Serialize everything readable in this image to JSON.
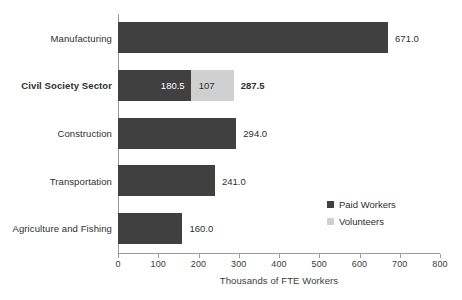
{
  "chart_data": {
    "type": "bar",
    "orientation": "horizontal",
    "stacked": true,
    "title": "",
    "xlabel": "Thousands of FTE Workers",
    "ylabel": "",
    "xlim": [
      0,
      800
    ],
    "xticks": [
      0,
      100,
      200,
      300,
      400,
      500,
      600,
      700,
      800
    ],
    "xtick_labels": [
      "0",
      "100",
      "200",
      "300",
      "400",
      "500",
      "600",
      "700",
      "800"
    ],
    "grid": false,
    "legend_position": "inside-right",
    "categories": [
      "Manufacturing",
      "Civil Society Sector",
      "Construction",
      "Transportation",
      "Agriculture and Fishing"
    ],
    "series": [
      {
        "name": "Paid Workers",
        "color": "#404040",
        "values": [
          671.0,
          180.5,
          294.0,
          241.0,
          160.0
        ]
      },
      {
        "name": "Volunteers",
        "color": "#d0d0d0",
        "values": [
          0,
          107,
          0,
          0,
          0
        ]
      }
    ],
    "totals": [
      671.0,
      287.5,
      294.0,
      241.0,
      160.0
    ],
    "data_labels": {
      "end_labels": [
        "671.0",
        "287.5",
        "294.0",
        "241.0",
        "160.0"
      ],
      "segment_labels": [
        {
          "category": "Civil Society Sector",
          "series": "Paid Workers",
          "text": "180.5"
        },
        {
          "category": "Civil Society Sector",
          "series": "Volunteers",
          "text": "107"
        }
      ]
    },
    "emphasis_category": "Civil Society Sector"
  },
  "axis": {
    "x_title": "Thousands of FTE Workers",
    "ticks": [
      {
        "label": "0",
        "value": 0
      },
      {
        "label": "100",
        "value": 100
      },
      {
        "label": "200",
        "value": 200
      },
      {
        "label": "300",
        "value": 300
      },
      {
        "label": "400",
        "value": 400
      },
      {
        "label": "500",
        "value": 500
      },
      {
        "label": "600",
        "value": 600
      },
      {
        "label": "700",
        "value": 700
      },
      {
        "label": "800",
        "value": 800
      }
    ]
  },
  "rows": [
    {
      "label": "Manufacturing",
      "bold": false,
      "paid": 671.0,
      "volunteers": 0,
      "paid_label": "",
      "volunteers_label": "",
      "end_label": "671.0",
      "end_label_bold": false
    },
    {
      "label": "Civil Society Sector",
      "bold": true,
      "paid": 180.5,
      "volunteers": 107,
      "paid_label": "180.5",
      "volunteers_label": "107",
      "end_label": "287.5",
      "end_label_bold": true
    },
    {
      "label": "Construction",
      "bold": false,
      "paid": 294.0,
      "volunteers": 0,
      "paid_label": "",
      "volunteers_label": "",
      "end_label": "294.0",
      "end_label_bold": false
    },
    {
      "label": "Transportation",
      "bold": false,
      "paid": 241.0,
      "volunteers": 0,
      "paid_label": "",
      "volunteers_label": "",
      "end_label": "241.0",
      "end_label_bold": false
    },
    {
      "label": "Agriculture and Fishing",
      "bold": false,
      "paid": 160.0,
      "volunteers": 0,
      "paid_label": "",
      "volunteers_label": "",
      "end_label": "160.0",
      "end_label_bold": false
    }
  ],
  "legend": {
    "items": [
      {
        "label": "Paid Workers",
        "color": "#404040",
        "key": "paid"
      },
      {
        "label": "Volunteers",
        "color": "#d0d0d0",
        "key": "vol"
      }
    ]
  }
}
